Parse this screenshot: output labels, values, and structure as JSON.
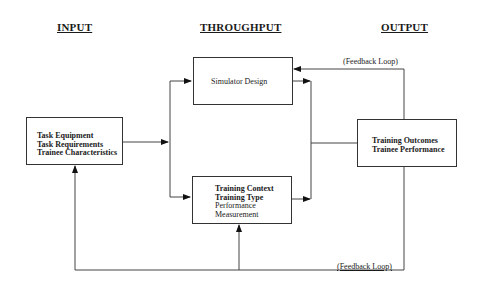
{
  "headers": {
    "input": "INPUT",
    "throughput": "THROUGHPUT",
    "output": "OUTPUT"
  },
  "boxes": {
    "input": {
      "lines": [
        "Task Equipment",
        "Task Requirements",
        "Trainee Characteristics"
      ]
    },
    "simulator": {
      "lines": [
        "Simulator Design"
      ]
    },
    "training": {
      "lines": [
        "Training Context",
        "Training Type",
        "Performance",
        "Measurement"
      ]
    },
    "output": {
      "lines": [
        "Training Outcomes",
        "Trainee Performance"
      ]
    }
  },
  "labels": {
    "feedback_top": "(Feedback Loop)",
    "feedback_bottom": "(Feedback Loop)"
  }
}
